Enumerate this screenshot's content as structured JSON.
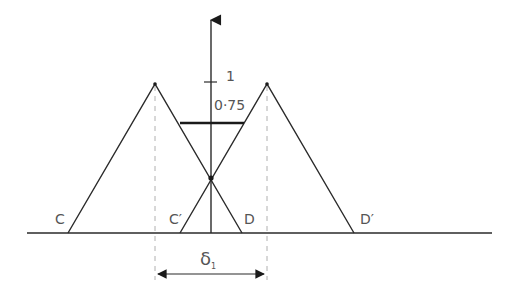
{
  "diagram": {
    "colors": {
      "line": "#2a2a2a",
      "dashed": "#b0b0b0",
      "text": "#555555"
    },
    "axis": {
      "tick_one_label": "1",
      "tick_level_label": "0·75"
    },
    "points": {
      "C": "C",
      "C_prime": "C′",
      "D": "D",
      "D_prime": "D′"
    },
    "shift": {
      "label": "δ",
      "subscript": "1"
    }
  }
}
